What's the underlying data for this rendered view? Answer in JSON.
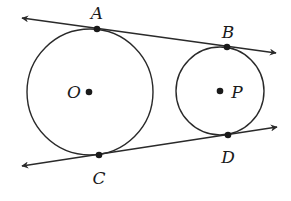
{
  "diagram": {
    "colors": {
      "stroke": "#2a2a2a",
      "point": "#1a1a1a",
      "background": "#ffffff"
    },
    "circles": [
      {
        "name": "O",
        "center": [
          90,
          92
        ],
        "radius": 63
      },
      {
        "name": "P",
        "center": [
          220,
          91
        ],
        "radius": 44
      }
    ],
    "lines": [
      {
        "name": "tangent-AB",
        "from": [
          22,
          18
        ],
        "to": [
          276,
          53
        ],
        "arrows": "both"
      },
      {
        "name": "tangent-CD",
        "from": [
          22,
          166
        ],
        "to": [
          277,
          127
        ],
        "arrows": "both"
      }
    ],
    "points": {
      "A": {
        "label": "A",
        "pos": [
          97,
          29
        ]
      },
      "B": {
        "label": "B",
        "pos": [
          227,
          47
        ]
      },
      "C": {
        "label": "C",
        "pos": [
          99,
          155
        ]
      },
      "D": {
        "label": "D",
        "pos": [
          228,
          135
        ]
      },
      "O": {
        "label": "O",
        "pos": [
          89,
          92
        ]
      },
      "P": {
        "label": "P",
        "pos": [
          220,
          91
        ]
      }
    }
  }
}
